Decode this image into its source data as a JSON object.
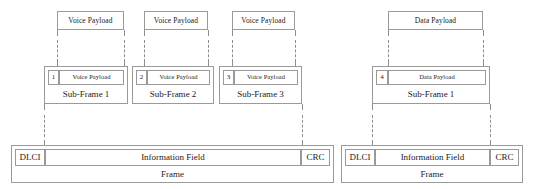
{
  "diagram": {
    "colors": {
      "stroke": "#9a9a9a",
      "text": "#1a1a1a",
      "background": "#ffffff"
    },
    "groups": [
      {
        "name": "voice-group",
        "top_payloads": [
          {
            "label": "Voice Payload"
          },
          {
            "label": "Voice Payload"
          },
          {
            "label": "Voice Payload"
          }
        ],
        "sub_frames": [
          {
            "number": "1",
            "payload_label": "Voice Payload",
            "caption": "Sub-Frame 1"
          },
          {
            "number": "2",
            "payload_label": "Voice Payload",
            "caption": "Sub-Frame 2"
          },
          {
            "number": "3",
            "payload_label": "Voice Payload",
            "caption": "Sub-Frame 3"
          }
        ],
        "frame": {
          "dlci_label": "DLCI",
          "information_label": "Information Field",
          "crc_label": "CRC",
          "caption": "Frame"
        }
      },
      {
        "name": "data-group",
        "top_payloads": [
          {
            "label": "Data Payload"
          }
        ],
        "sub_frames": [
          {
            "number": "4",
            "payload_label": "Data Payload",
            "caption": "Sub-Frame 1"
          }
        ],
        "frame": {
          "dlci_label": "DLCI",
          "information_label": "Information Field",
          "crc_label": "CRC",
          "caption": "Frame"
        }
      }
    ]
  }
}
